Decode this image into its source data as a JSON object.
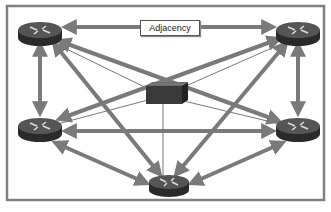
{
  "diagram": {
    "title_label": "Adjacency",
    "colors": {
      "frame": "#808080",
      "arrow": "#7a7a7a",
      "thin_line": "#555555",
      "router_top": "#4a4a4a",
      "router_side": "#2a2a2a",
      "switch_body": "#3a3a3a"
    },
    "nodes": [
      {
        "id": "R1",
        "type": "router",
        "position": "top-left"
      },
      {
        "id": "R2",
        "type": "router",
        "position": "top-right"
      },
      {
        "id": "R3",
        "type": "router",
        "position": "middle-left"
      },
      {
        "id": "R4",
        "type": "router",
        "position": "middle-right"
      },
      {
        "id": "R5",
        "type": "router",
        "position": "bottom-center"
      },
      {
        "id": "SW",
        "type": "switch",
        "position": "center"
      }
    ],
    "adjacencies": [
      [
        "R1",
        "R2"
      ],
      [
        "R1",
        "R3"
      ],
      [
        "R1",
        "R4"
      ],
      [
        "R1",
        "R5"
      ],
      [
        "R2",
        "R3"
      ],
      [
        "R2",
        "R4"
      ],
      [
        "R2",
        "R5"
      ],
      [
        "R3",
        "R4"
      ],
      [
        "R3",
        "R5"
      ],
      [
        "R4",
        "R5"
      ]
    ],
    "physical_links": [
      [
        "SW",
        "R1"
      ],
      [
        "SW",
        "R2"
      ],
      [
        "SW",
        "R3"
      ],
      [
        "SW",
        "R4"
      ],
      [
        "SW",
        "R5"
      ]
    ]
  }
}
